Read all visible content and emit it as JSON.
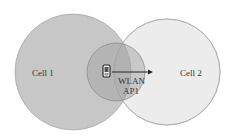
{
  "diagram": {
    "cells": [
      {
        "id": "cell1",
        "label": "Cell 1",
        "cx": 73,
        "cy": 72,
        "r": 58,
        "fill": "#c4c4c4",
        "stroke": "#a8a8a8",
        "label_x": 38,
        "label_y": 76
      },
      {
        "id": "cell2",
        "label": "Cell 2",
        "cx": 167,
        "cy": 72,
        "r": 53,
        "fill": "#ececec",
        "stroke": "#bdbdbd",
        "label_x": 178,
        "label_y": 76
      }
    ],
    "wlan": {
      "label_line1": "WLAN",
      "label_line2": "AP1",
      "cx": 116,
      "cy": 72,
      "r": 29,
      "fill": "#b0b0b0",
      "stroke": "#9a9a9a"
    },
    "device": {
      "icon": "mobile-device-icon",
      "x": 102,
      "y": 65
    },
    "arrow": {
      "x1": 113,
      "y1": 72,
      "x2": 152,
      "y2": 72,
      "color": "#222222"
    }
  }
}
